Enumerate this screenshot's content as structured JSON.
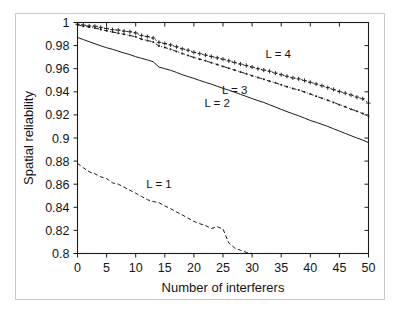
{
  "figure": {
    "background_color": "#ffffff",
    "frame_color": "#c9c9c9",
    "ink_color": "#1a1a1a"
  },
  "chart_data": {
    "type": "line",
    "title": "",
    "subtitle": "",
    "xlabel": "Number of interferers",
    "ylabel": "Spatial reliability",
    "xlim": [
      0,
      50
    ],
    "ylim": [
      0.8,
      1.0
    ],
    "grid": false,
    "legend_position": "inline-annotations",
    "xticks": [
      0,
      5,
      10,
      15,
      20,
      25,
      30,
      35,
      40,
      45,
      50
    ],
    "xticklabels": [
      "0",
      "5",
      "10",
      "15",
      "20",
      "25",
      "30",
      "35",
      "40",
      "45",
      "50"
    ],
    "yticks": [
      0.8,
      0.82,
      0.84,
      0.86,
      0.88,
      0.9,
      0.92,
      0.94,
      0.96,
      0.98,
      1.0
    ],
    "yticklabels": [
      "0.8",
      "0.82",
      "0.84",
      "0.86",
      "0.88",
      "0.9",
      "0.92",
      "0.94",
      "0.96",
      "0.98",
      "1"
    ],
    "annotations": [
      {
        "text": "L = 4",
        "x": 34.5,
        "y": 0.9695
      },
      {
        "text": "L = 3",
        "x": 27.0,
        "y": 0.9385
      },
      {
        "text": "L = 2",
        "x": 24.0,
        "y": 0.9265
      },
      {
        "text": "L = 1",
        "x": 14.0,
        "y": 0.8565
      }
    ],
    "x": [
      0,
      1,
      2,
      3,
      4,
      5,
      6,
      7,
      8,
      9,
      10,
      11,
      12,
      13,
      14,
      15,
      16,
      17,
      18,
      19,
      20,
      21,
      22,
      23,
      24,
      25,
      26,
      27,
      28,
      29,
      30,
      31,
      32,
      33,
      34,
      35,
      36,
      37,
      38,
      39,
      40,
      41,
      42,
      43,
      44,
      45,
      46,
      47,
      48,
      49,
      50
    ],
    "series": [
      {
        "name": "L = 4",
        "linestyle": "dotted",
        "marker": "plus",
        "values": [
          0.9985,
          0.9978,
          0.997,
          0.9968,
          0.9958,
          0.9948,
          0.9938,
          0.9934,
          0.9925,
          0.992,
          0.991,
          0.9888,
          0.9878,
          0.9866,
          0.9828,
          0.9818,
          0.9806,
          0.979,
          0.9772,
          0.976,
          0.9742,
          0.973,
          0.9718,
          0.9706,
          0.9694,
          0.9682,
          0.9668,
          0.9654,
          0.964,
          0.9628,
          0.9614,
          0.96,
          0.9588,
          0.9578,
          0.9562,
          0.9548,
          0.9534,
          0.952,
          0.9512,
          0.9498,
          0.9482,
          0.9468,
          0.9452,
          0.9436,
          0.942,
          0.9402,
          0.9388,
          0.9372,
          0.9354,
          0.934,
          0.9302
        ]
      },
      {
        "name": "L = 3",
        "linestyle": "dashdot",
        "marker": "dot",
        "values": [
          0.998,
          0.9968,
          0.996,
          0.9952,
          0.994,
          0.9928,
          0.9918,
          0.9908,
          0.9898,
          0.9888,
          0.9876,
          0.9856,
          0.9844,
          0.9832,
          0.9796,
          0.9784,
          0.9768,
          0.975,
          0.9732,
          0.9714,
          0.9698,
          0.9682,
          0.9668,
          0.9652,
          0.9636,
          0.962,
          0.9604,
          0.9588,
          0.9572,
          0.9556,
          0.954,
          0.9524,
          0.9508,
          0.9492,
          0.9478,
          0.946,
          0.9444,
          0.9428,
          0.9416,
          0.9398,
          0.938,
          0.9362,
          0.9344,
          0.9326,
          0.9308,
          0.9288,
          0.927,
          0.925,
          0.9232,
          0.9212,
          0.9188
        ]
      },
      {
        "name": "L = 2",
        "linestyle": "solid",
        "marker": "none",
        "values": [
          0.987,
          0.9852,
          0.9834,
          0.9816,
          0.9798,
          0.9782,
          0.9768,
          0.9752,
          0.9736,
          0.9722,
          0.9704,
          0.969,
          0.9676,
          0.966,
          0.9614,
          0.96,
          0.9586,
          0.9568,
          0.9548,
          0.9532,
          0.9516,
          0.9498,
          0.9482,
          0.9466,
          0.9448,
          0.943,
          0.9414,
          0.9396,
          0.9378,
          0.936,
          0.9342,
          0.9324,
          0.9308,
          0.9288,
          0.9268,
          0.9248,
          0.9228,
          0.921,
          0.9192,
          0.9172,
          0.9152,
          0.9136,
          0.9118,
          0.91,
          0.908,
          0.906,
          0.904,
          0.902,
          0.9,
          0.8982,
          0.896
        ]
      },
      {
        "name": "L = 1",
        "linestyle": "dashed",
        "marker": "none",
        "values": [
          0.878,
          0.8742,
          0.8708,
          0.869,
          0.8664,
          0.8648,
          0.8612,
          0.86,
          0.8574,
          0.8548,
          0.8522,
          0.8494,
          0.8466,
          0.845,
          0.844,
          0.8412,
          0.8388,
          0.836,
          0.8334,
          0.8306,
          0.8278,
          0.8258,
          0.8242,
          0.8216,
          0.8232,
          0.8212,
          0.809,
          0.8048,
          0.8028,
          0.801,
          0.8,
          0.8,
          0.8,
          0.8,
          0.8,
          0.8,
          0.8,
          0.8,
          0.8,
          0.8,
          0.8,
          0.8,
          0.8,
          0.8,
          0.8,
          0.8,
          0.8,
          0.8,
          0.8,
          0.8,
          0.8
        ]
      }
    ]
  }
}
